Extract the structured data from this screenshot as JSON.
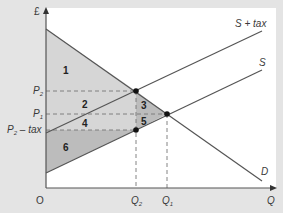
{
  "diagram": {
    "type": "economics-tax-incidence",
    "y_axis_label": "£",
    "x_axis_label": "Q",
    "origin_label": "O",
    "curves": {
      "supply_with_tax": "S + tax",
      "supply": "S",
      "demand": "D"
    },
    "price_labels": {
      "p2": "P",
      "p2_sub": "2",
      "p1": "P",
      "p1_sub": "1",
      "p2_tax": "P",
      "p2_tax_sub": "2",
      "p2_tax_suffix": " – tax"
    },
    "quantity_labels": {
      "q2": "Q",
      "q2_sub": "2",
      "q1": "Q",
      "q1_sub": "1"
    },
    "regions": [
      "1",
      "2",
      "3",
      "4",
      "5",
      "6"
    ],
    "colors": {
      "background": "#e4e4e4",
      "panel": "#ffffff",
      "light_shade": "#d6d6d6",
      "dark_shade": "#bcbcbc",
      "line": "#555555",
      "dot": "#111111"
    }
  }
}
